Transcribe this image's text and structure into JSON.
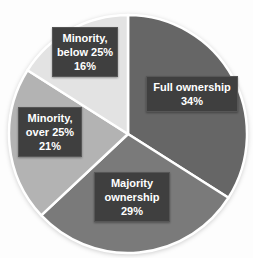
{
  "chart_data": {
    "type": "pie",
    "legend_position": "none",
    "start_angle_deg": 0,
    "direction": "clockwise",
    "background": "#fdfdfd",
    "separator_color": "#ffffff",
    "label_bg": "#3f3f3f",
    "label_text_color": "#ffffff",
    "categories": [
      "Full ownership",
      "Majority ownership",
      "Minority, over 25%",
      "Minority, below 25%"
    ],
    "values": [
      34,
      29,
      21,
      16
    ],
    "slices": [
      {
        "label": "Full ownership",
        "pct_label": "34%",
        "value": 34,
        "color": "#666666"
      },
      {
        "label": "Majority ownership",
        "pct_label": "29%",
        "value": 29,
        "color": "#7a7a7a"
      },
      {
        "label": "Minority, over 25%",
        "pct_label": "21%",
        "value": 21,
        "color": "#b3b3b3"
      },
      {
        "label": "Minority, below 25%",
        "pct_label": "16%",
        "value": 16,
        "color": "#e3e3e3"
      }
    ]
  }
}
